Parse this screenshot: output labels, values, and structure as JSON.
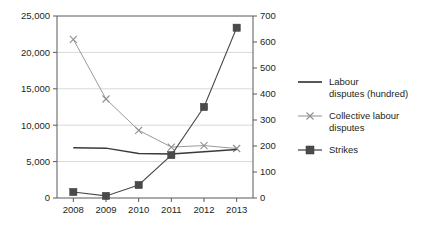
{
  "chart_data": {
    "type": "line",
    "title": "",
    "xlabel": "",
    "ylabel": "",
    "grid": true,
    "legend_position": "right",
    "categories": [
      "2008",
      "2009",
      "2010",
      "2011",
      "2012",
      "2013"
    ],
    "axes": {
      "left": {
        "min": 0,
        "max": 25000,
        "step": 5000,
        "ticks": [
          "0",
          "5,000",
          "10,000",
          "15,000",
          "20,000",
          "25,000"
        ],
        "tick_values": [
          0,
          5000,
          10000,
          15000,
          20000,
          25000
        ]
      },
      "right": {
        "min": 0,
        "max": 700,
        "step": 100,
        "ticks": [
          "0",
          "100",
          "200",
          "300",
          "400",
          "500",
          "600",
          "700"
        ],
        "tick_values": [
          0,
          100,
          200,
          300,
          400,
          500,
          600,
          700
        ]
      },
      "x": {
        "ticks": [
          "2008",
          "2009",
          "2010",
          "2011",
          "2012",
          "2013"
        ]
      }
    },
    "series": [
      {
        "name": "Labour disputes (hundred)",
        "axis": "left",
        "marker": "none",
        "color": "#3a3a3c",
        "values": [
          6900,
          6850,
          6100,
          6050,
          6350,
          6650
        ]
      },
      {
        "name": "Collective labour disputes",
        "axis": "left",
        "marker": "x",
        "color": "#8f8f8f",
        "values": [
          21800,
          13600,
          9300,
          7000,
          7200,
          6800
        ]
      },
      {
        "name": "Strikes",
        "axis": "right",
        "marker": "square",
        "color": "#4a4a4c",
        "values": [
          23,
          8,
          50,
          165,
          350,
          655
        ]
      }
    ]
  },
  "legend": {
    "items": [
      {
        "label_line1": "Labour",
        "label_line2": "disputes (hundred)",
        "marker": "line"
      },
      {
        "label_line1": "Collective labour",
        "label_line2": "disputes",
        "marker": "line-x"
      },
      {
        "label_line1": "Strikes",
        "label_line2": "",
        "marker": "line-square"
      }
    ]
  }
}
